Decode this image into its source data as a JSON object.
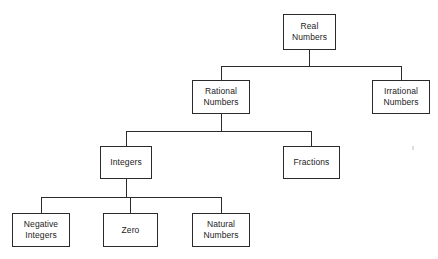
{
  "diagram": {
    "background_color": "#ffffff",
    "line_color": "#2b2b2b",
    "text_color": "#232323",
    "nodes": {
      "real_numbers": {
        "label": "Real\nNumbers",
        "x": 283,
        "y": 14,
        "w": 53,
        "h": 36
      },
      "rational_numbers": {
        "label": "Rational\nNumbers",
        "x": 192,
        "y": 80,
        "w": 58,
        "h": 34
      },
      "irrational_numbers": {
        "label": "Irrational\nNumbers",
        "x": 372,
        "y": 80,
        "w": 58,
        "h": 34
      },
      "integers": {
        "label": "Integers",
        "x": 100,
        "y": 146,
        "w": 52,
        "h": 33
      },
      "fractions": {
        "label": "Fractions",
        "x": 283,
        "y": 146,
        "w": 57,
        "h": 33
      },
      "negative_integers": {
        "label": "Negative\nIntegers",
        "x": 12,
        "y": 213,
        "w": 58,
        "h": 34
      },
      "zero": {
        "label": "Zero",
        "x": 103,
        "y": 213,
        "w": 55,
        "h": 34
      },
      "natural_numbers": {
        "label": "Natural\nNumbers",
        "x": 192,
        "y": 213,
        "w": 58,
        "h": 34
      }
    },
    "connections": [
      {
        "from": "real_numbers",
        "to": "rational_numbers"
      },
      {
        "from": "real_numbers",
        "to": "irrational_numbers"
      },
      {
        "from": "rational_numbers",
        "to": "integers"
      },
      {
        "from": "rational_numbers",
        "to": "fractions"
      },
      {
        "from": "integers",
        "to": "negative_integers"
      },
      {
        "from": "integers",
        "to": "zero"
      },
      {
        "from": "integers",
        "to": "natural_numbers"
      }
    ]
  }
}
